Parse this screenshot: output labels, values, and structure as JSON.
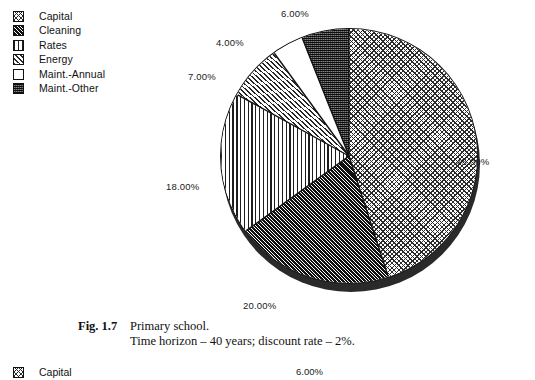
{
  "figure": {
    "legend": {
      "items": [
        {
          "label": "Capital",
          "pattern": "crosshatch-weave"
        },
        {
          "label": "Cleaning",
          "pattern": "dense-diagonal-dark"
        },
        {
          "label": "Rates",
          "pattern": "vertical-lines"
        },
        {
          "label": "Energy",
          "pattern": "diagonal-hatch"
        },
        {
          "label": "Maint.-Annual",
          "pattern": "solid-white"
        },
        {
          "label": "Maint.-Other",
          "pattern": "dark-stipple"
        }
      ]
    },
    "caption": {
      "fig_number": "Fig. 1.7",
      "line1": "Primary school.",
      "line2": "Time horizon – 40 years; discount rate – 2%."
    }
  },
  "next_figure": {
    "legend_first_label": "Capital",
    "first_pct_label": "6.00%"
  },
  "chart_data": {
    "type": "pie",
    "subtitle": "",
    "xlabel": "",
    "ylabel": "",
    "legend_position": "top-left",
    "grid": false,
    "start_angle_deg": 0,
    "direction": "clockwise",
    "categories": [
      "Capital",
      "Cleaning",
      "Rates",
      "Energy",
      "Maint.-Annual",
      "Maint.-Other"
    ],
    "values": [
      45,
      20,
      18,
      7,
      4,
      6
    ],
    "data_labels": [
      "45.00%",
      "20.00%",
      "18.00%",
      "7.00%",
      "4.00%",
      "6.00%"
    ],
    "units": "percent",
    "total": 100,
    "slices": [
      {
        "name": "Capital",
        "value": 45,
        "label": "45.00%",
        "start_deg": 0,
        "end_deg": 162,
        "pattern": "crosshatch-weave"
      },
      {
        "name": "Cleaning",
        "value": 20,
        "label": "20.00%",
        "start_deg": 162,
        "end_deg": 234,
        "pattern": "dense-diagonal-dark"
      },
      {
        "name": "Rates",
        "value": 18,
        "label": "18.00%",
        "start_deg": 234,
        "end_deg": 298.8,
        "pattern": "vertical-lines"
      },
      {
        "name": "Energy",
        "value": 7,
        "label": "7.00%",
        "start_deg": 298.8,
        "end_deg": 324,
        "pattern": "diagonal-hatch"
      },
      {
        "name": "Maint.-Annual",
        "value": 4,
        "label": "4.00%",
        "start_deg": 324,
        "end_deg": 338.4,
        "pattern": "solid-white"
      },
      {
        "name": "Maint.-Other",
        "value": 6,
        "label": "6.00%",
        "start_deg": 338.4,
        "end_deg": 360,
        "pattern": "dark-stipple"
      }
    ]
  }
}
